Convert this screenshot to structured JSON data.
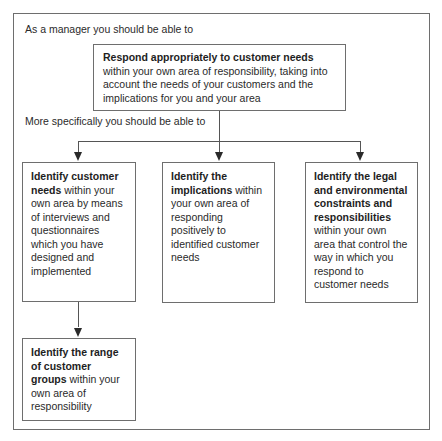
{
  "diagram": {
    "intro": "As a manager you should be able to",
    "top": {
      "bold": "Respond appropriately to customer needs",
      "rest": "within your own area of responsibility, taking into account the needs of your customers and the implications for you and your area"
    },
    "specific": "More specifically you should be able to",
    "left": {
      "bold": "Identify customer needs",
      "rest": "within your own area by means of interviews and questionnaires which you have designed and implemented"
    },
    "middle": {
      "bold": "Identify the implications",
      "rest": "within your own area of responding positively to identified customer needs"
    },
    "right": {
      "bold": "Identify the legal and environmental constraints and responsibilities",
      "rest": "within your own area that control the way in which you respond to customer needs"
    },
    "bottom": {
      "bold": "Identify the range of customer groups",
      "rest": "within your own area of responsibility"
    },
    "colors": {
      "border": "#6e6e6e",
      "text": "#2a2a2a",
      "background": "#ffffff"
    }
  }
}
